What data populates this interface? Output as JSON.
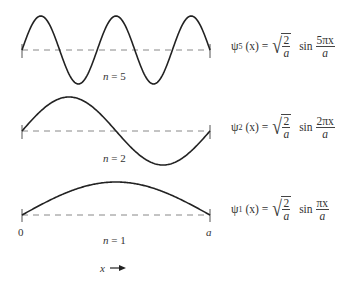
{
  "diagram": {
    "axis": {
      "start_label": "0",
      "end_label": "a",
      "direction_label": "x"
    },
    "plots": [
      {
        "n": 5,
        "n_label": "n = 5",
        "psi_symbol": "ψ",
        "subscript": "5",
        "lhs_arg": "(x) =",
        "sqrt_num": "2",
        "sqrt_den": "a",
        "sin_label": "sin",
        "sin_num": "5πx",
        "sin_den": "a"
      },
      {
        "n": 2,
        "n_label": "n = 2",
        "psi_symbol": "ψ",
        "subscript": "2",
        "lhs_arg": "(x) =",
        "sqrt_num": "2",
        "sqrt_den": "a",
        "sin_label": "sin",
        "sin_num": "2πx",
        "sin_den": "a"
      },
      {
        "n": 1,
        "n_label": "n = 1",
        "psi_symbol": "ψ",
        "subscript": "1",
        "lhs_arg": "(x) =",
        "sqrt_num": "2",
        "sqrt_den": "a",
        "sin_label": "sin",
        "sin_num": "πx",
        "sin_den": "a"
      }
    ]
  },
  "colors": {
    "curve": "#222222",
    "baseline": "#777777",
    "text": "#333333"
  }
}
